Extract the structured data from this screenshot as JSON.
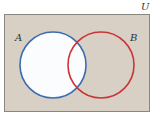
{
  "diagram": {
    "type": "venn",
    "universe_label": "U",
    "sets": [
      {
        "label": "A",
        "color": "#3c6cb0",
        "shaded": true
      },
      {
        "label": "B",
        "color": "#cc3338",
        "shaded": false
      }
    ],
    "highlighted_region": "A",
    "colors": {
      "background": "#d8d0c4",
      "highlight": "#fbfcfe",
      "border": "#8a8680"
    }
  }
}
